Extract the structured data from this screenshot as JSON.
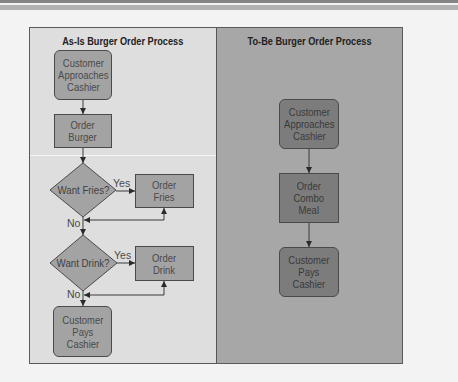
{
  "as_is": {
    "title": "As-Is Burger Order Process",
    "nodes": [
      {
        "id": "approach",
        "type": "terminal",
        "label": "Customer\nApproaches\nCashier"
      },
      {
        "id": "order_burger",
        "type": "process",
        "label": "Order\nBurger"
      },
      {
        "id": "want_fries",
        "type": "decision",
        "label": "Want Fries?"
      },
      {
        "id": "order_fries",
        "type": "process",
        "label": "Order\nFries"
      },
      {
        "id": "want_drink",
        "type": "decision",
        "label": "Want Drink?"
      },
      {
        "id": "order_drink",
        "type": "process",
        "label": "Order\nDrink"
      },
      {
        "id": "pays",
        "type": "terminal",
        "label": "Customer\nPays\nCashier"
      }
    ],
    "edge_labels": {
      "fries_yes": "Yes",
      "fries_no": "No",
      "drink_yes": "Yes",
      "drink_no": "No"
    }
  },
  "to_be": {
    "title": "To-Be Burger Order Process",
    "nodes": [
      {
        "id": "approach",
        "type": "terminal",
        "label": "Customer\nApproaches\nCashier"
      },
      {
        "id": "order_combo",
        "type": "process",
        "label": "Order\nCombo\nMeal"
      },
      {
        "id": "pays",
        "type": "terminal",
        "label": "Customer\nPays\nCashier"
      }
    ]
  },
  "colors": {
    "page_background": "#f3f3f3",
    "as_is_panel": "#dedede",
    "to_be_panel": "#a7a7a7",
    "as_is_node_fill": "#a3a3a3",
    "to_be_node_fill": "#7c7c7c",
    "border": "#4a4a4a"
  }
}
